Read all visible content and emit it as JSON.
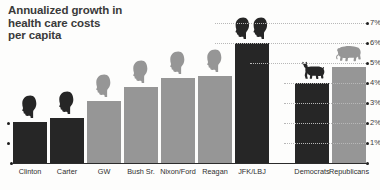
{
  "chart_data": {
    "type": "bar",
    "title": "Annualized growth in\nhealth care costs\nper capita",
    "xlabel": "",
    "ylabel": "",
    "ylim": [
      0,
      7.2
    ],
    "grid": true,
    "legend": "none",
    "y_tick_labels": [
      "1%",
      "2%",
      "3%",
      "4%",
      "5%",
      "6%",
      "7%"
    ],
    "y_tick_values": [
      1,
      2,
      3,
      4,
      5,
      6,
      7
    ],
    "y_axis_position": "right",
    "categories": [
      "Clinton",
      "Carter",
      "GW",
      "Bush Sr.",
      "Nixon/Ford",
      "Reagan",
      "JFK/LBJ",
      "Democrats",
      "Republicans"
    ],
    "values": [
      2.05,
      2.25,
      3.1,
      3.8,
      4.25,
      4.35,
      6.0,
      4.0,
      4.8
    ],
    "bar_colors": [
      "#262626",
      "#262626",
      "#969696",
      "#969696",
      "#969696",
      "#969696",
      "#262626",
      "#262626",
      "#969696"
    ],
    "party": [
      "Democrat",
      "Democrat",
      "Republican",
      "Republican",
      "Republican",
      "Republican",
      "Democrat",
      "Democrat",
      "Republican"
    ],
    "icons": [
      "head-silhouette",
      "head-silhouette",
      "head-silhouette",
      "head-silhouette",
      "head-silhouette",
      "head-silhouette",
      "head-silhouette-pair",
      "donkey-icon",
      "elephant-icon"
    ],
    "annotations": []
  },
  "colors": {
    "dark_bar": "#262626",
    "light_bar": "#969696",
    "axis": "#2b2b2b",
    "grid": "#b8b8b8",
    "title_text": "#3a3a3a",
    "label_text": "#2f2f2f",
    "background": "#fdfdfc"
  }
}
